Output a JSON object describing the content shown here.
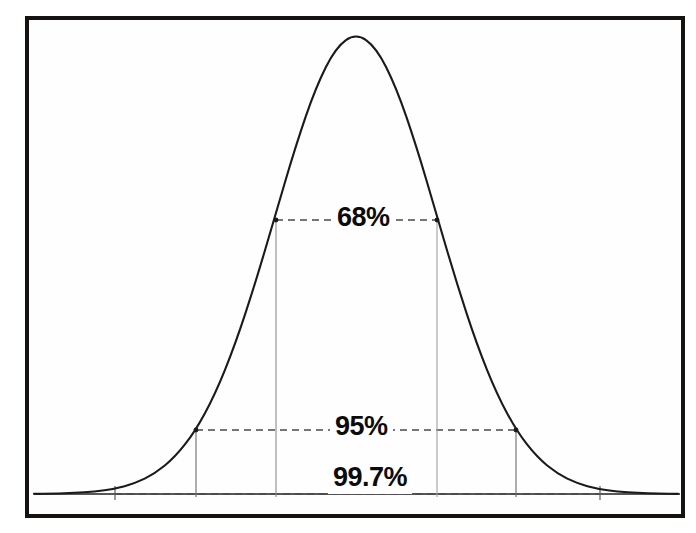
{
  "figure": {
    "kind": "normal-distribution-empirical-rule-diagram",
    "background_color": "#ffffff",
    "frame_color": "#15120f",
    "curve_color": "#1a1a1a",
    "guide_color": "#4a4a4a"
  },
  "labels": {
    "band_68": "68%",
    "band_95": "95%",
    "band_997": "99.7%"
  },
  "chart_data": {
    "type": "line",
    "title": "",
    "subtitle": "",
    "xlabel": "",
    "ylabel": "",
    "grid": false,
    "legend": null,
    "curve": "normal probability density (bell curve)",
    "mean_x_px": 356,
    "peak_y_px": 33,
    "baseline_y_px": 494,
    "xlim": [
      35,
      680
    ],
    "ylim": [
      0,
      1
    ],
    "x": [
      -4,
      -3.75,
      -3.5,
      -3.25,
      -3,
      -2.75,
      -2.5,
      -2.25,
      -2,
      -1.75,
      -1.5,
      -1.25,
      -1,
      -0.75,
      -0.5,
      -0.25,
      0,
      0.25,
      0.5,
      0.75,
      1,
      1.25,
      1.5,
      1.75,
      2,
      2.25,
      2.5,
      2.75,
      3,
      3.25,
      3.5,
      3.75,
      4
    ],
    "y": [
      0.0003,
      0.0009,
      0.0022,
      0.0051,
      0.0111,
      0.0228,
      0.0439,
      0.0796,
      0.1353,
      0.2163,
      0.3247,
      0.4578,
      0.6065,
      0.7548,
      0.8825,
      0.9692,
      1.0,
      0.9692,
      0.8825,
      0.7548,
      0.6065,
      0.4578,
      0.3247,
      0.2163,
      0.1353,
      0.0796,
      0.0439,
      0.0228,
      0.0111,
      0.0051,
      0.0022,
      0.0009,
      0.0003
    ],
    "annotations": [
      {
        "label": "68%",
        "meaning": "proportion of data within 1 standard deviation of the mean",
        "sigma_range": [
          -1,
          1
        ],
        "left_x_px": 276,
        "right_x_px": 437,
        "line_y_px": 220,
        "curve_height_at_edge": 0.6065
      },
      {
        "label": "95%",
        "meaning": "proportion of data within 2 standard deviations of the mean",
        "sigma_range": [
          -2,
          2
        ],
        "left_x_px": 196,
        "right_x_px": 516,
        "line_y_px": 430,
        "curve_height_at_edge": 0.1353
      },
      {
        "label": "99.7%",
        "meaning": "proportion of data within 3 standard deviations of the mean",
        "sigma_range": [
          -3,
          3
        ],
        "left_x_px": 115,
        "right_x_px": 600,
        "line_y_px": 494,
        "curve_height_at_edge": 0.0111
      }
    ]
  }
}
